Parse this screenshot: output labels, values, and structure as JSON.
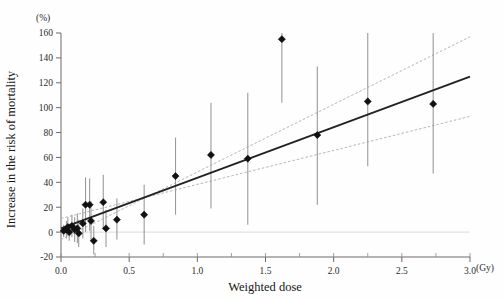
{
  "chart_data": {
    "type": "scatter",
    "title": "",
    "xlabel": "Weighted dose",
    "ylabel": "Increase in the risk of mortality",
    "y_unit": "(%)",
    "x_unit": "(Gy)",
    "xlim": [
      0.0,
      3.0
    ],
    "ylim": [
      -20,
      160
    ],
    "xticks": [
      0.0,
      0.5,
      1.0,
      1.5,
      2.0,
      2.5,
      3.0
    ],
    "xticklabels": [
      "0.0",
      "0.5",
      "1.0",
      "1.5",
      "2.0",
      "2.5",
      "3.0"
    ],
    "x_minor_step": 0.25,
    "yticks": [
      -20,
      0,
      20,
      40,
      60,
      80,
      100,
      120,
      140,
      160
    ],
    "yticklabels": [
      "-20",
      "0",
      "20",
      "40",
      "60",
      "80",
      "100",
      "120",
      "140",
      "160"
    ],
    "grid": false,
    "legend": "none",
    "marker_color": "#111111",
    "fit_color": "#222222",
    "ci_color": "#b5b5b5",
    "errorbar_color": "#9a9a9a",
    "points": [
      {
        "x": 0.02,
        "y": 1,
        "ylo": -4,
        "yhi": 6
      },
      {
        "x": 0.04,
        "y": 2,
        "ylo": -5,
        "yhi": 9
      },
      {
        "x": 0.05,
        "y": 4,
        "ylo": -3,
        "yhi": 12
      },
      {
        "x": 0.06,
        "y": 0,
        "ylo": -7,
        "yhi": 7
      },
      {
        "x": 0.08,
        "y": 5,
        "ylo": -4,
        "yhi": 14
      },
      {
        "x": 0.1,
        "y": 2,
        "ylo": -8,
        "yhi": 12
      },
      {
        "x": 0.12,
        "y": 3,
        "ylo": -9,
        "yhi": 15
      },
      {
        "x": 0.13,
        "y": -1,
        "ylo": -12,
        "yhi": 10
      },
      {
        "x": 0.16,
        "y": 7,
        "ylo": -5,
        "yhi": 19
      },
      {
        "x": 0.18,
        "y": 22,
        "ylo": 0,
        "yhi": 44
      },
      {
        "x": 0.21,
        "y": 22,
        "ylo": 1,
        "yhi": 43
      },
      {
        "x": 0.22,
        "y": 9,
        "ylo": -7,
        "yhi": 25
      },
      {
        "x": 0.24,
        "y": -7,
        "ylo": -18,
        "yhi": 5
      },
      {
        "x": 0.31,
        "y": 24,
        "ylo": 2,
        "yhi": 46
      },
      {
        "x": 0.33,
        "y": 3,
        "ylo": -12,
        "yhi": 18
      },
      {
        "x": 0.41,
        "y": 10,
        "ylo": -6,
        "yhi": 27
      },
      {
        "x": 0.61,
        "y": 14,
        "ylo": -10,
        "yhi": 38
      },
      {
        "x": 0.84,
        "y": 45,
        "ylo": 14,
        "yhi": 76
      },
      {
        "x": 1.1,
        "y": 62,
        "ylo": 19,
        "yhi": 104
      },
      {
        "x": 1.37,
        "y": 59,
        "ylo": 6,
        "yhi": 112
      },
      {
        "x": 1.62,
        "y": 155,
        "ylo": 104,
        "yhi": 163
      },
      {
        "x": 1.88,
        "y": 78,
        "ylo": 22,
        "yhi": 133
      },
      {
        "x": 2.25,
        "y": 105,
        "ylo": 53,
        "yhi": 160
      },
      {
        "x": 2.73,
        "y": 103,
        "ylo": 47,
        "yhi": 160
      }
    ],
    "fit_line": {
      "x0": 0.0,
      "y0": 3,
      "x1": 3.0,
      "y1": 125
    },
    "ci_upper": {
      "x0": 0.0,
      "y0": -6,
      "x1": 3.0,
      "y1": 157
    },
    "ci_lower": {
      "x0": 0.0,
      "y0": 11,
      "x1": 3.0,
      "y1": 93
    }
  }
}
